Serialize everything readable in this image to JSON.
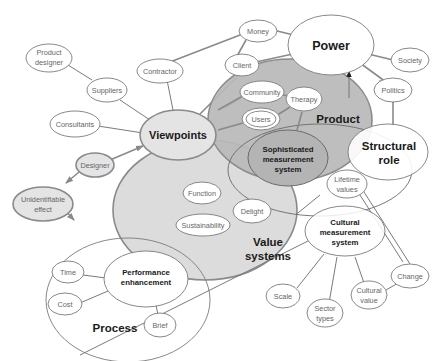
{
  "diagram": {
    "major_nodes": {
      "power": "Power",
      "viewpoints": "Viewpoints",
      "product": "Product",
      "structural_role_line1": "Structural",
      "structural_role_line2": "role",
      "value_systems_line1": "Value",
      "value_systems_line2": "systems",
      "process": "Process",
      "sophisticated_line1": "Sophisticated",
      "sophisticated_line2": "measurement",
      "sophisticated_line3": "system",
      "performance_line1": "Performance",
      "performance_line2": "enhancement",
      "cultural_line1": "Cultural",
      "cultural_line2": "measurement",
      "cultural_line3": "system"
    },
    "minor_nodes": {
      "money": "Money",
      "client": "Client",
      "contractor": "Contractor",
      "product_designer_line1": "Product",
      "product_designer_line2": "designer",
      "suppliers": "Suppliers",
      "consultants": "Consultants",
      "designer": "Designer",
      "unidentifiable_line1": "Unidentifiable",
      "unidentifiable_line2": "effect",
      "society": "Society",
      "politics": "Politics",
      "community": "Community",
      "therapy": "Therapy",
      "users": "Users",
      "function": "Function",
      "delight": "Delight",
      "sustainability": "Sustainability",
      "lifetime_line1": "Lifetime",
      "lifetime_line2": "values",
      "change": "Change",
      "scale": "Scale",
      "sector_line1": "Sector",
      "sector_line2": "types",
      "cultural_value_line1": "Cultural",
      "cultural_value_line2": "value",
      "time": "Time",
      "cost": "Cost",
      "brief": "Brief"
    },
    "colors": {
      "product_fill": "#b8b8b8",
      "value_systems_fill": "#dcdcdc",
      "viewpoints_fill": "#e2e2e2",
      "stroke": "#7a7a7a"
    }
  }
}
